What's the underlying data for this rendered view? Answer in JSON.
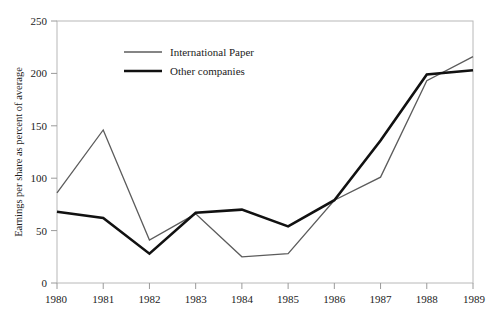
{
  "chart_data": {
    "type": "line",
    "title": "",
    "xlabel": "",
    "ylabel": "Earnings per share as percent of average",
    "x": [
      1980,
      1981,
      1982,
      1983,
      1984,
      1985,
      1986,
      1987,
      1988,
      1989
    ],
    "xticklabels": [
      "1980",
      "1981",
      "1982",
      "1983",
      "1984",
      "1985",
      "1986",
      "1987",
      "1988",
      "1989"
    ],
    "yticklabels": [
      "0",
      "50",
      "100",
      "150",
      "200",
      "250"
    ],
    "yticks": [
      0,
      50,
      100,
      150,
      200,
      250
    ],
    "ylim": [
      0,
      250
    ],
    "xlim": [
      1980,
      1989
    ],
    "grid": false,
    "legend_position": "top-left-inside",
    "series": [
      {
        "name": "International Paper",
        "values": [
          86,
          146,
          41,
          66,
          25,
          28,
          79,
          101,
          193,
          216
        ],
        "color": "#5c5c5c",
        "width": 1.3
      },
      {
        "name": "Other companies",
        "values": [
          68,
          62,
          28,
          67,
          70,
          54,
          79,
          136,
          199,
          203
        ],
        "color": "#111111",
        "width": 2.6
      }
    ]
  },
  "axes": {
    "frame_color": "#b8b8b8",
    "tick_color": "#9a9a9a"
  },
  "legend": {
    "entries": [
      {
        "label": "International Paper",
        "color": "#5c5c5c",
        "width": 1.3
      },
      {
        "label": "Other companies",
        "color": "#111111",
        "width": 2.6
      }
    ]
  }
}
